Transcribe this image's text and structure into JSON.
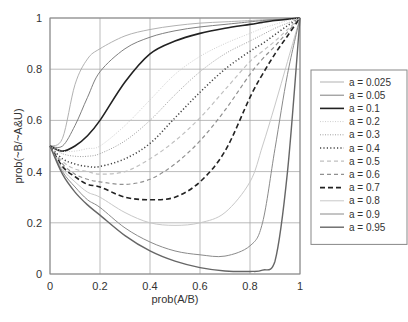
{
  "chart_data": {
    "type": "line",
    "title": "",
    "xlabel": "prob(A/B)",
    "ylabel": "prob(~B/~A&U)",
    "xlim": [
      0,
      1
    ],
    "ylim": [
      0,
      1
    ],
    "grid": true,
    "legend_position": "right",
    "xticks": [
      "0",
      "0.2",
      "0.4",
      "0.6",
      "0.8",
      "1"
    ],
    "yticks": [
      "0",
      "0.2",
      "0.4",
      "0.6",
      "0.8",
      "1"
    ],
    "x": [
      0,
      0.05,
      0.1,
      0.15,
      0.2,
      0.3,
      0.4,
      0.5,
      0.6,
      0.7,
      0.8,
      0.85,
      0.9,
      0.95,
      1
    ],
    "series": [
      {
        "name": "a = 0.025",
        "color": "#a8a8a8",
        "style": "solid",
        "width": 0.9,
        "values": [
          0.5,
          0.53,
          0.74,
          0.84,
          0.88,
          0.93,
          0.955,
          0.97,
          0.98,
          0.985,
          0.99,
          0.993,
          0.995,
          0.998,
          1
        ]
      },
      {
        "name": "a = 0.05",
        "color": "#707070",
        "style": "solid",
        "width": 0.9,
        "values": [
          0.5,
          0.5,
          0.58,
          0.69,
          0.79,
          0.88,
          0.925,
          0.95,
          0.965,
          0.975,
          0.985,
          0.99,
          0.993,
          0.997,
          1
        ]
      },
      {
        "name": "a = 0.1",
        "color": "#222222",
        "style": "solid",
        "width": 1.6,
        "values": [
          0.5,
          0.48,
          0.5,
          0.54,
          0.6,
          0.75,
          0.86,
          0.91,
          0.94,
          0.96,
          0.975,
          0.983,
          0.99,
          0.995,
          1
        ]
      },
      {
        "name": "a = 0.2",
        "color": "#cfcfcf",
        "style": "dotted-fine",
        "width": 1,
        "values": [
          0.5,
          0.48,
          0.48,
          0.49,
          0.5,
          0.58,
          0.68,
          0.78,
          0.85,
          0.9,
          0.94,
          0.96,
          0.975,
          0.99,
          1
        ]
      },
      {
        "name": "a = 0.3",
        "color": "#a0a0a0",
        "style": "dotted-fine",
        "width": 1,
        "values": [
          0.5,
          0.47,
          0.46,
          0.46,
          0.47,
          0.52,
          0.6,
          0.7,
          0.79,
          0.86,
          0.91,
          0.935,
          0.96,
          0.98,
          1
        ]
      },
      {
        "name": "a = 0.4",
        "color": "#444444",
        "style": "dotted",
        "width": 1.5,
        "values": [
          0.5,
          0.45,
          0.43,
          0.42,
          0.42,
          0.45,
          0.51,
          0.61,
          0.71,
          0.8,
          0.87,
          0.9,
          0.935,
          0.97,
          1
        ]
      },
      {
        "name": "a = 0.5",
        "color": "#c0c0c0",
        "style": "dashed-short",
        "width": 1.2,
        "values": [
          0.5,
          0.44,
          0.41,
          0.4,
          0.39,
          0.4,
          0.45,
          0.52,
          0.61,
          0.72,
          0.83,
          0.87,
          0.91,
          0.955,
          1
        ]
      },
      {
        "name": "a = 0.6",
        "color": "#909090",
        "style": "dashed-short",
        "width": 1.2,
        "values": [
          0.5,
          0.43,
          0.39,
          0.37,
          0.36,
          0.35,
          0.37,
          0.43,
          0.52,
          0.64,
          0.78,
          0.84,
          0.89,
          0.945,
          1
        ]
      },
      {
        "name": "a = 0.7",
        "color": "#222222",
        "style": "dashed",
        "width": 1.6,
        "values": [
          0.5,
          0.42,
          0.38,
          0.35,
          0.34,
          0.3,
          0.29,
          0.3,
          0.36,
          0.48,
          0.69,
          0.78,
          0.86,
          0.93,
          1
        ]
      },
      {
        "name": "a = 0.8",
        "color": "#c8c8c8",
        "style": "solid",
        "width": 1,
        "values": [
          0.5,
          0.41,
          0.36,
          0.32,
          0.3,
          0.24,
          0.2,
          0.19,
          0.2,
          0.24,
          0.36,
          0.5,
          0.66,
          0.83,
          1
        ]
      },
      {
        "name": "a = 0.9",
        "color": "#8a8a8a",
        "style": "solid",
        "width": 1,
        "values": [
          0.5,
          0.4,
          0.34,
          0.29,
          0.26,
          0.18,
          0.125,
          0.09,
          0.075,
          0.07,
          0.11,
          0.2,
          0.49,
          0.78,
          1
        ]
      },
      {
        "name": "a = 0.95",
        "color": "#666666",
        "style": "solid",
        "width": 1.4,
        "values": [
          0.5,
          0.39,
          0.32,
          0.27,
          0.23,
          0.15,
          0.09,
          0.05,
          0.025,
          0.012,
          0.01,
          0.015,
          0.05,
          0.4,
          1
        ]
      }
    ]
  }
}
